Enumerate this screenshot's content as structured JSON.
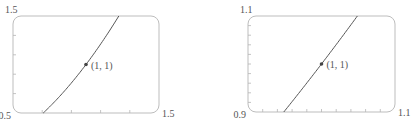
{
  "chart_data": [
    {
      "type": "line",
      "title": "",
      "function": "y = x^2",
      "xlim": [
        0.5,
        1.5
      ],
      "ylim": [
        0.5,
        1.5
      ],
      "x_tick_step": 0.2,
      "y_tick_step": 0.2,
      "corner_labels": {
        "xmin": "0.5",
        "xmax": "1.5",
        "ymax": "1.5"
      },
      "series": [
        {
          "name": "y = x^2",
          "x": [
            0.7071,
            0.8,
            0.9,
            1.0,
            1.1,
            1.2,
            1.2247
          ],
          "y": [
            0.5,
            0.64,
            0.81,
            1.0,
            1.21,
            1.44,
            1.5
          ]
        }
      ],
      "annotations": [
        {
          "x": 1,
          "y": 1,
          "text": "(1, 1)"
        }
      ],
      "grid": false
    },
    {
      "type": "line",
      "title": "",
      "function": "y = x^2",
      "xlim": [
        0.9,
        1.1
      ],
      "ylim": [
        0.9,
        1.1
      ],
      "x_tick_step": 0.02,
      "y_tick_step": 0.02,
      "corner_labels": {
        "xmin": "0.9",
        "xmax": "1.1",
        "ymax": "1.1"
      },
      "series": [
        {
          "name": "y = x^2",
          "x": [
            0.9487,
            0.97,
            1.0,
            1.03,
            1.0488
          ],
          "y": [
            0.9,
            0.9409,
            1.0,
            1.0609,
            1.1
          ]
        }
      ],
      "annotations": [
        {
          "x": 1,
          "y": 1,
          "text": "(1, 1)"
        }
      ],
      "grid": false
    }
  ]
}
